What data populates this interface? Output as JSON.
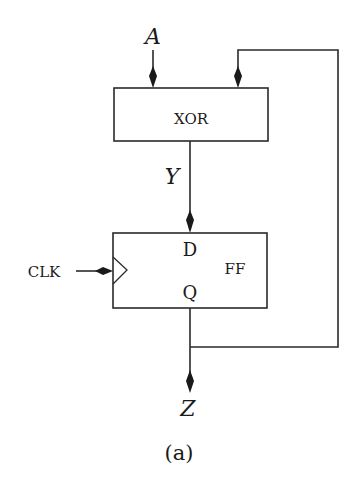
{
  "diagram": {
    "type": "circuit",
    "caption": "(a)",
    "inputs": {
      "a": "A",
      "clk": "CLK"
    },
    "signals": {
      "y": "Y",
      "z": "Z"
    },
    "blocks": [
      {
        "id": "xor",
        "label": "XOR"
      },
      {
        "id": "ff",
        "label": "FF",
        "port_d": "D",
        "port_q": "Q"
      }
    ],
    "connections": [
      {
        "from": "A",
        "to": "XOR"
      },
      {
        "from": "XOR",
        "to": "FF.D",
        "label": "Y"
      },
      {
        "from": "CLK",
        "to": "FF.clock"
      },
      {
        "from": "FF.Q",
        "to": "Z"
      },
      {
        "from": "FF.Q",
        "to": "XOR",
        "type": "feedback"
      }
    ],
    "colors": {
      "line": "#2a2a2a",
      "background": "#ffffff"
    }
  }
}
